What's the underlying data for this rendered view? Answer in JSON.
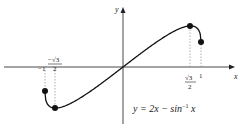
{
  "chart_data": {
    "type": "line",
    "title": "",
    "equation": "y = 2x − sin⁻¹ x",
    "xlabel": "x",
    "ylabel": "y",
    "xlim": [
      -1,
      1
    ],
    "domain": [
      -1,
      1
    ],
    "x_ticks": [
      {
        "value": -1,
        "label": "−1"
      },
      {
        "value": -0.866,
        "label": "−√3/2"
      },
      {
        "value": 0.866,
        "label": "√3/2"
      },
      {
        "value": 1,
        "label": "1"
      }
    ],
    "marked_points": [
      {
        "x": -1,
        "y": -0.429,
        "note": "left endpoint"
      },
      {
        "x": -0.866,
        "y": -0.685,
        "note": "local minimum"
      },
      {
        "x": 0.866,
        "y": 0.685,
        "note": "local maximum"
      },
      {
        "x": 1,
        "y": 0.429,
        "note": "right endpoint"
      }
    ],
    "grid": false,
    "dashed_guides": true,
    "colors": {
      "curve": "#111111",
      "axes": "#333333",
      "guides": "#999999"
    }
  },
  "labels": {
    "x_axis": "x",
    "y_axis": "y",
    "tick_neg_one": "−1",
    "tick_neg_root3_num": "−√3",
    "tick_neg_root3_den": "2",
    "tick_root3_num": "√3",
    "tick_root3_den": "2",
    "tick_one": "1",
    "equation_main": "y = 2x − sin",
    "equation_sup": "−1",
    "equation_tail": " x"
  }
}
